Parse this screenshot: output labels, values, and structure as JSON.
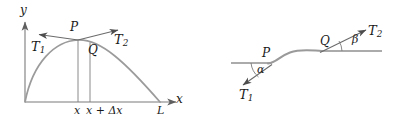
{
  "figure": {
    "caption": "",
    "panels": [
      {
        "id": "left-panel",
        "name": "vibrating-string-element-diagram",
        "axes": {
          "y_label": "y",
          "x_label": "x"
        },
        "labels": {
          "P": "P",
          "Q": "Q",
          "T1": "T",
          "T1_sub": "1",
          "T2": "T",
          "T2_sub": "2",
          "tick_x": "x",
          "tick_x_dx": "x + Δx",
          "L": "L"
        },
        "colors": {
          "curve": "#8a8a8a",
          "axis": "#7b7b7b",
          "arrow": "#6b6b6b",
          "text": "#1a1a1a"
        }
      },
      {
        "id": "right-panel",
        "name": "string-segment-tension-angles-diagram",
        "labels": {
          "P": "P",
          "Q": "Q",
          "T1": "T",
          "T1_sub": "1",
          "T2": "T",
          "T2_sub": "2",
          "alpha": "α",
          "beta": "β"
        },
        "colors": {
          "curve": "#9a9a9a",
          "line": "#8f8f8f",
          "arrow": "#5f5f5f",
          "text": "#1a1a1a"
        }
      }
    ]
  }
}
